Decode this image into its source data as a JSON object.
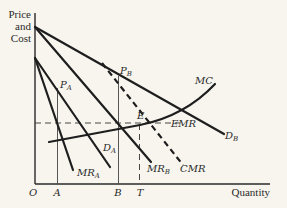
{
  "diagram": {
    "type": "economics-price-discrimination",
    "axes": {
      "y_label_lines": [
        "Price",
        "and",
        "Cost"
      ],
      "x_label": "Quantity",
      "origin_label": "O"
    },
    "x_ticks": [
      {
        "label": "A",
        "x": 57
      },
      {
        "label": "B",
        "x": 118
      },
      {
        "label": "T",
        "x": 139
      }
    ],
    "curves": [
      {
        "id": "DB",
        "label": "D",
        "sub": "B",
        "style": "solid"
      },
      {
        "id": "MRB",
        "label": "MR",
        "sub": "B",
        "style": "solid"
      },
      {
        "id": "DA",
        "label": "D",
        "sub": "A",
        "style": "solid"
      },
      {
        "id": "MRA",
        "label": "MR",
        "sub": "A",
        "style": "solid"
      },
      {
        "id": "CMR",
        "label": "CMR",
        "sub": "",
        "style": "dashed"
      },
      {
        "id": "MC",
        "label": "MC",
        "sub": "",
        "style": "solid"
      },
      {
        "id": "EMR",
        "label": "EMR",
        "sub": "",
        "style": "dashed"
      }
    ],
    "points": [
      {
        "label": "E"
      },
      {
        "label": "P",
        "sub": "A"
      },
      {
        "label": "P",
        "sub": "B"
      }
    ]
  }
}
